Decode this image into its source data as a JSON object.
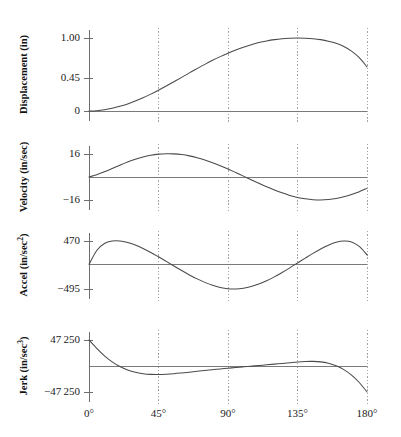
{
  "chart_data": {
    "type": "line",
    "title": "",
    "xlabel": "",
    "x_unit": "degrees",
    "grid": true,
    "legend": false,
    "xlim": [
      0,
      180
    ],
    "x_ticks": [
      0,
      45,
      90,
      135,
      180
    ],
    "x_tick_labels": [
      "0°",
      "45°",
      "90°",
      "135°",
      "180°"
    ],
    "panels": [
      {
        "id": "displacement",
        "ylabel": "Displacement (in)",
        "ylabel_base": "Displacement (in)",
        "ylabel_sup": "",
        "y_ticks": [
          1.0,
          0.45,
          0
        ],
        "y_tick_labels": [
          "1.00",
          "0.45",
          "0"
        ],
        "ylim": [
          0,
          1.0
        ],
        "zero_value": 0,
        "series": [
          {
            "name": "displacement",
            "x": [
              0,
              5,
              10,
              15,
              20,
              25,
              30,
              35,
              40,
              45,
              50,
              55,
              60,
              65,
              70,
              75,
              80,
              85,
              90,
              95,
              100,
              105,
              110,
              115,
              120,
              125,
              130,
              135,
              140,
              145,
              150,
              155,
              160,
              165,
              170,
              175,
              180
            ],
            "values": [
              0,
              0.004,
              0.017,
              0.037,
              0.064,
              0.097,
              0.136,
              0.181,
              0.231,
              0.285,
              0.342,
              0.401,
              0.461,
              0.522,
              0.581,
              0.639,
              0.694,
              0.745,
              0.792,
              0.835,
              0.874,
              0.908,
              0.937,
              0.96,
              0.978,
              0.991,
              0.998,
              1.0,
              0.998,
              0.991,
              0.978,
              0.957,
              0.927,
              0.883,
              0.82,
              0.73,
              0.604
            ]
          }
        ]
      },
      {
        "id": "velocity",
        "ylabel": "Velocity (in/sec)",
        "ylabel_base": "Velocity (in/sec)",
        "ylabel_sup": "",
        "y_ticks": [
          16,
          -16
        ],
        "y_tick_labels": [
          "16",
          "−16"
        ],
        "ylim": [
          -16,
          16
        ],
        "zero_value": 0,
        "series": [
          {
            "name": "velocity",
            "x": [
              0,
              5,
              10,
              15,
              20,
              25,
              30,
              35,
              40,
              45,
              50,
              55,
              60,
              65,
              70,
              75,
              80,
              85,
              90,
              95,
              100,
              105,
              110,
              115,
              120,
              125,
              130,
              135,
              140,
              145,
              150,
              155,
              160,
              165,
              170,
              175,
              180
            ],
            "values": [
              0,
              1.6,
              3.6,
              5.9,
              8.2,
              10.4,
              12.3,
              13.9,
              15.1,
              15.9,
              16.2,
              16.1,
              15.6,
              14.7,
              13.4,
              11.8,
              9.9,
              7.8,
              5.5,
              3.1,
              0.6,
              -1.9,
              -4.4,
              -6.8,
              -9.0,
              -11.0,
              -12.8,
              -14.2,
              -15.2,
              -15.8,
              -16.0,
              -15.7,
              -15.0,
              -13.8,
              -12.2,
              -10.2,
              -7.9
            ]
          }
        ]
      },
      {
        "id": "acceleration",
        "ylabel": "Accel (in/sec2)",
        "ylabel_base": "Accel (in/sec",
        "ylabel_sup": "2",
        "y_ticks": [
          470,
          -495
        ],
        "y_tick_labels": [
          "470",
          "−495"
        ],
        "ylim": [
          -495,
          470
        ],
        "zero_value": 0,
        "series": [
          {
            "name": "acceleration",
            "x": [
              0,
              5,
              10,
              15,
              20,
              25,
              30,
              35,
              40,
              45,
              50,
              55,
              60,
              65,
              70,
              75,
              80,
              85,
              90,
              95,
              100,
              105,
              110,
              115,
              120,
              125,
              130,
              135,
              140,
              145,
              150,
              155,
              160,
              165,
              170,
              175,
              180
            ],
            "values": [
              0,
              280,
              420,
              468,
              470,
              440,
              388,
              320,
              240,
              152,
              60,
              -32,
              -124,
              -212,
              -292,
              -362,
              -420,
              -464,
              -490,
              -495,
              -480,
              -446,
              -396,
              -330,
              -252,
              -164,
              -70,
              28,
              126,
              222,
              310,
              386,
              444,
              470,
              452,
              360,
              190
            ]
          }
        ]
      },
      {
        "id": "jerk",
        "ylabel": "Jerk (in/sec3)",
        "ylabel_base": "Jerk (in/sec",
        "ylabel_sup": "3",
        "y_ticks": [
          47250,
          -47250
        ],
        "y_tick_labels": [
          "47 250",
          "−47 250"
        ],
        "ylim": [
          -47250,
          47250
        ],
        "zero_value": 0,
        "series": [
          {
            "name": "jerk",
            "x": [
              0,
              5,
              10,
              15,
              20,
              25,
              30,
              35,
              40,
              45,
              50,
              55,
              60,
              65,
              70,
              75,
              80,
              85,
              90,
              95,
              100,
              105,
              110,
              115,
              120,
              125,
              130,
              135,
              140,
              145,
              150,
              155,
              160,
              165,
              170,
              175,
              180
            ],
            "values": [
              47250,
              32000,
              18500,
              7500,
              -1000,
              -7200,
              -11500,
              -14000,
              -15200,
              -15400,
              -14900,
              -13900,
              -12600,
              -11200,
              -9700,
              -8200,
              -6700,
              -5300,
              -4000,
              -2700,
              -1500,
              -300,
              900,
              2100,
              3400,
              4700,
              6000,
              7300,
              8200,
              8400,
              7500,
              5000,
              500,
              -6500,
              -16500,
              -30000,
              -47250
            ]
          }
        ]
      }
    ]
  }
}
